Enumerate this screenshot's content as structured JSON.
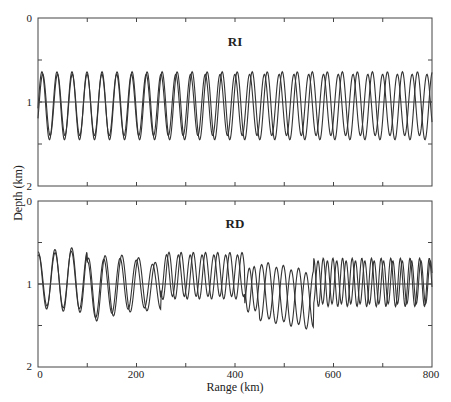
{
  "chart_data": [
    {
      "type": "line",
      "title": "RI",
      "xlabel": "Range (km)",
      "ylabel": "Depth (km)",
      "xlim": [
        0,
        800
      ],
      "ylim": [
        2,
        0
      ],
      "x_ticks": [
        0,
        100,
        200,
        300,
        400,
        500,
        600,
        700,
        800
      ],
      "y_ticks": [
        0,
        0.5,
        1,
        1.5,
        2
      ],
      "y_tick_labels": [
        "0",
        "",
        "1",
        "",
        "2"
      ],
      "reference_line_depth": 1.0,
      "grid": false,
      "series": [
        {
          "name": "ray path A",
          "period_km": 30.5,
          "phase_deg": 0,
          "peak_depth": 0.64,
          "trough_depth": 1.45,
          "phase_drift_deg": 0
        },
        {
          "name": "ray path B",
          "period_km": 30.0,
          "phase_deg": -20,
          "peak_depth": 0.67,
          "trough_depth": 1.4,
          "phase_drift_deg": 0
        }
      ]
    },
    {
      "type": "line",
      "title": "RD",
      "xlabel": "Range (km)",
      "ylabel": "Depth (km)",
      "xlim": [
        0,
        800
      ],
      "ylim": [
        2,
        0
      ],
      "x_ticks": [
        0,
        100,
        200,
        300,
        400,
        500,
        600,
        700,
        800
      ],
      "x_tick_labels": [
        "0",
        "",
        "200",
        "",
        "400",
        "",
        "600",
        "",
        "800"
      ],
      "y_ticks": [
        0,
        0.5,
        1,
        1.5,
        2
      ],
      "y_tick_labels": [
        "0",
        "",
        "1",
        "",
        "2"
      ],
      "reference_line_depth": 1.0,
      "grid": false,
      "series": [
        {
          "name": "ray path A",
          "x": [
            0,
            20,
            40,
            60,
            80,
            100,
            120,
            140,
            160,
            180,
            200,
            220,
            240,
            260,
            280,
            300,
            320,
            340,
            360,
            380,
            400,
            420,
            440,
            460,
            480,
            500,
            520,
            540,
            560,
            580,
            600,
            620,
            640,
            660,
            680,
            700,
            720,
            740,
            760,
            780,
            800
          ]
        },
        {
          "name": "ray path B"
        }
      ]
    }
  ],
  "figure": {
    "ylabel": "Depth (km)",
    "xlabel": "Range (km)",
    "panels": [
      {
        "title": "RI",
        "y_labels": [
          "0",
          "1",
          "2"
        ]
      },
      {
        "title": "RD",
        "y_labels": [
          "0",
          "1",
          "2"
        ],
        "x_labels": [
          "0",
          "200",
          "400",
          "600",
          "800"
        ]
      }
    ]
  }
}
